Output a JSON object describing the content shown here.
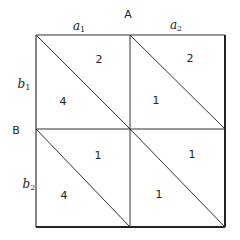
{
  "factor_a": {
    "label": "A",
    "levels": [
      {
        "base": "a",
        "sub": "1"
      },
      {
        "base": "a",
        "sub": "2"
      }
    ]
  },
  "factor_b": {
    "label": "B",
    "levels": [
      {
        "base": "b",
        "sub": "1"
      },
      {
        "base": "b",
        "sub": "2"
      }
    ]
  },
  "cells": [
    {
      "row": "b1",
      "col": "a1",
      "upper": "2",
      "lower": "4"
    },
    {
      "row": "b1",
      "col": "a2",
      "upper": "2",
      "lower": "1"
    },
    {
      "row": "b2",
      "col": "a1",
      "upper": "1",
      "lower": "4"
    },
    {
      "row": "b2",
      "col": "a2",
      "upper": "1",
      "lower": "1"
    }
  ],
  "colors": {
    "line": "#333333",
    "text": "#222222",
    "background": "#ffffff"
  }
}
